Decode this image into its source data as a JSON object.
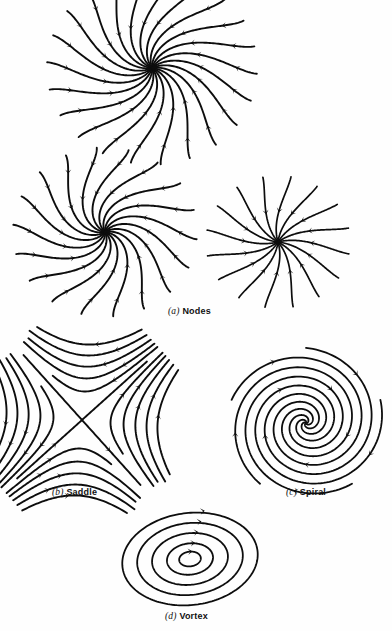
{
  "figure": {
    "background_color": "#fefefe",
    "ink_color": "#0d0d0d",
    "width": 392,
    "height": 631
  },
  "captions": [
    {
      "id": "a",
      "label": "(a)",
      "name": "Nodes",
      "x": 168,
      "y": 306
    },
    {
      "id": "b",
      "label": "(b)",
      "name": "Saddle",
      "x": 52,
      "y": 487
    },
    {
      "id": "c",
      "label": "(c)",
      "name": "Spiral",
      "x": 286,
      "y": 487
    },
    {
      "id": "d",
      "label": "(d)",
      "name": "Vortex",
      "x": 165,
      "y": 611
    }
  ],
  "panels": [
    {
      "id": "node-degenerate-top",
      "type": "node",
      "caption_ref": "a",
      "center": [
        152,
        68
      ],
      "rays": 22,
      "arrow_direction": "inward",
      "stroke_width": 1.9,
      "radius": 105,
      "swirl_deg": 62,
      "note": "improper node, trajectories enter the critical point tangent to a common line"
    },
    {
      "id": "node-improper-left",
      "type": "node",
      "caption_ref": "a",
      "center": [
        105,
        232
      ],
      "rays": 18,
      "arrow_direction": "inward",
      "stroke_width": 1.9,
      "radius": 92,
      "swirl_deg": 78,
      "note": "degenerate node with strong tangency, arrows converge to the point"
    },
    {
      "id": "node-star-right",
      "type": "node",
      "caption_ref": "a",
      "center": [
        278,
        242
      ],
      "rays": 16,
      "arrow_direction": "inward",
      "stroke_width": 1.7,
      "radius": 72,
      "swirl_deg": 26,
      "note": "proper (star) node, rays approach radially"
    },
    {
      "id": "saddle",
      "type": "saddle",
      "caption_ref": "b",
      "center": [
        82,
        420
      ],
      "rotation_deg": -42,
      "levels": [
        0.16,
        0.34,
        0.56,
        0.82,
        1.12
      ],
      "extent": 78,
      "stroke_width": 1.9,
      "arrow_direction": "in-along-one-axis-out-along-other"
    },
    {
      "id": "spiral",
      "type": "spiral",
      "caption_ref": "c",
      "center": [
        306,
        423
      ],
      "arms": 5,
      "turns": 1.85,
      "radius": 78,
      "sense": "clockwise-inward",
      "stroke_width": 1.8,
      "arrow_direction": "inward"
    },
    {
      "id": "vortex",
      "type": "vortex",
      "caption_ref": "d",
      "center": [
        190,
        559
      ],
      "rings": 5,
      "tilt_deg": -7,
      "rx": 68,
      "ry": 46,
      "ring_scales": [
        1.0,
        0.78,
        0.56,
        0.34,
        0.16
      ],
      "sense": "clockwise",
      "stroke_width": 1.8,
      "arrow_direction": "closed-orbit"
    }
  ],
  "chart_data": {
    "type": "diagram",
    "items": [
      {
        "label": "(a) Nodes",
        "count": 3,
        "character": "asymptotically stable, trajectories enter the critical point"
      },
      {
        "label": "(b) Saddle",
        "count": 1,
        "character": "unstable, two incoming and two outgoing separatrices"
      },
      {
        "label": "(c) Spiral",
        "count": 1,
        "character": "asymptotically stable, trajectories wind into the point"
      },
      {
        "label": "(d) Vortex",
        "count": 1,
        "character": "stable center, closed periodic orbits"
      }
    ]
  }
}
